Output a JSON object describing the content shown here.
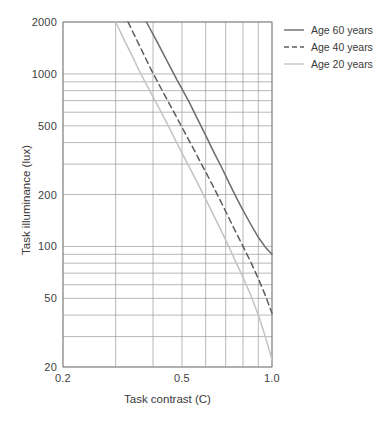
{
  "chart_data": {
    "type": "line",
    "title": "",
    "xlabel": "Task contrast (C)",
    "ylabel": "Task illuminance (lux)",
    "xscale": "log",
    "yscale": "log",
    "xlim": [
      0.2,
      1.0
    ],
    "ylim": [
      20,
      2000
    ],
    "grid": true,
    "legend_position": "top-right",
    "xticks": [
      {
        "value": 0.2,
        "label": "0.2"
      },
      {
        "value": 0.5,
        "label": "0.5"
      },
      {
        "value": 1.0,
        "label": "1.0"
      }
    ],
    "x_gridlines": [
      0.2,
      0.3,
      0.4,
      0.5,
      0.6,
      0.7,
      0.8,
      0.9,
      1.0
    ],
    "yticks": [
      {
        "value": 2000,
        "label": "2000"
      },
      {
        "value": 1000,
        "label": "1000"
      },
      {
        "value": 500,
        "label": "500"
      },
      {
        "value": 200,
        "label": "200"
      },
      {
        "value": 100,
        "label": "100"
      },
      {
        "value": 50,
        "label": "50"
      },
      {
        "value": 20,
        "label": "20"
      }
    ],
    "y_gridlines": [
      20,
      30,
      40,
      50,
      60,
      70,
      80,
      90,
      100,
      200,
      300,
      400,
      500,
      600,
      700,
      800,
      900,
      1000,
      2000
    ],
    "series": [
      {
        "name": "Age 60 years",
        "label": "Age 60 years",
        "style": "solid",
        "color": "#6b6b6b",
        "points": [
          [
            0.38,
            2000
          ],
          [
            0.4,
            1700
          ],
          [
            0.42,
            1450
          ],
          [
            0.45,
            1150
          ],
          [
            0.48,
            930
          ],
          [
            0.5,
            820
          ],
          [
            0.53,
            680
          ],
          [
            0.56,
            560
          ],
          [
            0.6,
            440
          ],
          [
            0.64,
            350
          ],
          [
            0.68,
            285
          ],
          [
            0.72,
            232
          ],
          [
            0.76,
            192
          ],
          [
            0.8,
            162
          ],
          [
            0.85,
            134
          ],
          [
            0.9,
            113
          ],
          [
            0.95,
            99
          ],
          [
            1.0,
            90
          ]
        ]
      },
      {
        "name": "Age 40 years",
        "label": "Age 40 years",
        "style": "dashed",
        "color": "#5d5d5d",
        "points": [
          [
            0.33,
            2000
          ],
          [
            0.35,
            1620
          ],
          [
            0.37,
            1330
          ],
          [
            0.39,
            1100
          ],
          [
            0.42,
            860
          ],
          [
            0.45,
            690
          ],
          [
            0.48,
            560
          ],
          [
            0.51,
            460
          ],
          [
            0.55,
            360
          ],
          [
            0.59,
            285
          ],
          [
            0.63,
            230
          ],
          [
            0.67,
            186
          ],
          [
            0.71,
            152
          ],
          [
            0.75,
            125
          ],
          [
            0.8,
            100
          ],
          [
            0.85,
            81
          ],
          [
            0.9,
            65
          ],
          [
            0.95,
            52
          ],
          [
            1.0,
            41
          ]
        ]
      },
      {
        "name": "Age 20 years",
        "label": "Age 20 years",
        "style": "solid-light",
        "color": "#c3c3c3",
        "points": [
          [
            0.3,
            2000
          ],
          [
            0.32,
            1580
          ],
          [
            0.34,
            1280
          ],
          [
            0.36,
            1040
          ],
          [
            0.39,
            800
          ],
          [
            0.42,
            630
          ],
          [
            0.45,
            500
          ],
          [
            0.48,
            400
          ],
          [
            0.52,
            305
          ],
          [
            0.56,
            238
          ],
          [
            0.6,
            188
          ],
          [
            0.64,
            150
          ],
          [
            0.68,
            121
          ],
          [
            0.72,
            98
          ],
          [
            0.76,
            80
          ],
          [
            0.8,
            66
          ],
          [
            0.85,
            52
          ],
          [
            0.9,
            40
          ],
          [
            0.95,
            30
          ],
          [
            1.0,
            22
          ]
        ]
      }
    ]
  },
  "axes": {
    "x_title": "Task contrast (C)",
    "y_title": "Task illuminance (lux)"
  },
  "legend": {
    "items": [
      {
        "label": "Age 60 years"
      },
      {
        "label": "Age 40 years"
      },
      {
        "label": "Age 20 years"
      }
    ]
  },
  "geometry": {
    "left": 63,
    "right": 272,
    "top": 22,
    "bottom": 367
  }
}
